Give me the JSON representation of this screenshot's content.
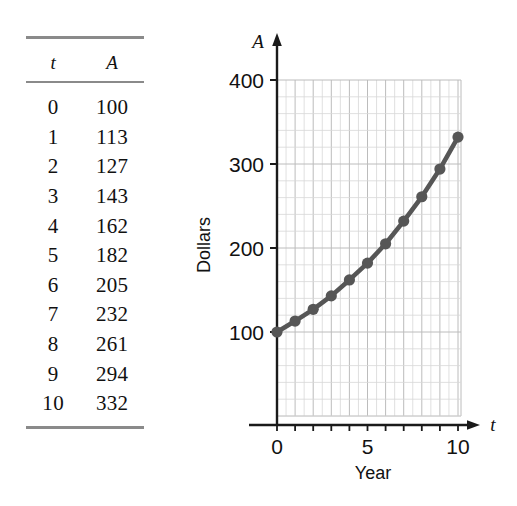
{
  "table": {
    "columns": [
      "t",
      "A"
    ],
    "rows": [
      [
        "0",
        "100"
      ],
      [
        "1",
        "113"
      ],
      [
        "2",
        "127"
      ],
      [
        "3",
        "143"
      ],
      [
        "4",
        "162"
      ],
      [
        "5",
        "182"
      ],
      [
        "6",
        "205"
      ],
      [
        "7",
        "232"
      ],
      [
        "8",
        "261"
      ],
      [
        "9",
        "294"
      ],
      [
        "10",
        "332"
      ]
    ]
  },
  "chart_data": {
    "type": "line",
    "title": "",
    "xlabel": "Year",
    "ylabel": "Dollars",
    "x_axis_symbol": "t",
    "y_axis_symbol": "A",
    "x": [
      0,
      1,
      2,
      3,
      4,
      5,
      6,
      7,
      8,
      9,
      10
    ],
    "values": [
      100,
      113,
      127,
      143,
      162,
      182,
      205,
      232,
      261,
      294,
      332
    ],
    "series": [
      {
        "name": "A",
        "values": [
          100,
          113,
          127,
          143,
          162,
          182,
          205,
          232,
          261,
          294,
          332
        ]
      }
    ],
    "xlim": [
      0,
      10
    ],
    "ylim": [
      0,
      400
    ],
    "x_tick_labels": [
      "0",
      "5",
      "10"
    ],
    "x_tick_values": [
      0,
      5,
      10
    ],
    "y_tick_labels": [
      "100",
      "200",
      "300",
      "400"
    ],
    "y_tick_values": [
      100,
      200,
      300,
      400
    ],
    "x_minor_step": 0.5,
    "y_minor_step": 20,
    "grid": true,
    "legend": "none",
    "marker": "circle",
    "colors": {
      "line": "#565656",
      "marker": "#565656",
      "grid": "#c8c8c8",
      "axis": "#1a1a1a"
    }
  }
}
